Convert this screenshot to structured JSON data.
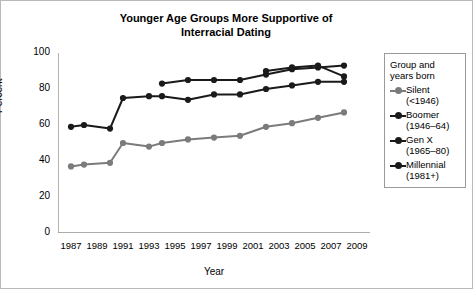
{
  "chart_data": {
    "type": "line",
    "title": "Younger Age Groups More Supportive of Interracial Dating",
    "title_line1": "Younger Age Groups More Supportive of",
    "title_line2": "Interracial Dating",
    "xlabel": "Year",
    "ylabel": "Percent",
    "ylim": [
      0,
      100
    ],
    "yticks": [
      0,
      20,
      40,
      60,
      80,
      100
    ],
    "xlim": [
      1986,
      2010
    ],
    "xticks": [
      1987,
      1989,
      1991,
      1993,
      1995,
      1997,
      1999,
      2001,
      2003,
      2005,
      2007,
      2009
    ],
    "grid": false,
    "legend_position": "right-outside",
    "legend_title_line1": "Group and",
    "legend_title_line2": "years born",
    "series": [
      {
        "name": "Silent",
        "legend_label": "Silent",
        "legend_sub": "(<1946)",
        "color": "#7b7b7b",
        "x": [
          1987,
          1988,
          1990,
          1991,
          1993,
          1994,
          1996,
          1998,
          2000,
          2002,
          2004,
          2006,
          2008
        ],
        "values": [
          37,
          38,
          39,
          50,
          48,
          50,
          52,
          53,
          54,
          59,
          61,
          64,
          67
        ]
      },
      {
        "name": "Boomer",
        "legend_label": "Boomer",
        "legend_sub": "(1946–64)",
        "color": "#1a1a1a",
        "x": [
          1987,
          1988,
          1990,
          1991,
          1993,
          1994,
          1996,
          1998,
          2000,
          2002,
          2004,
          2006,
          2008
        ],
        "values": [
          59,
          60,
          58,
          75,
          76,
          76,
          74,
          77,
          77,
          80,
          82,
          84,
          84
        ]
      },
      {
        "name": "Gen X",
        "legend_label": "Gen X",
        "legend_sub": "(1965–80)",
        "color": "#1a1a1a",
        "x": [
          1994,
          1996,
          1998,
          2000,
          2002,
          2004,
          2006,
          2008
        ],
        "values": [
          83,
          85,
          85,
          85,
          88,
          91,
          92,
          93
        ]
      },
      {
        "name": "Millennial",
        "legend_label": "Millennial",
        "legend_sub": "(1981+)",
        "color": "#1a1a1a",
        "x": [
          2002,
          2004,
          2006,
          2008
        ],
        "values": [
          90,
          92,
          93,
          87
        ]
      }
    ]
  }
}
